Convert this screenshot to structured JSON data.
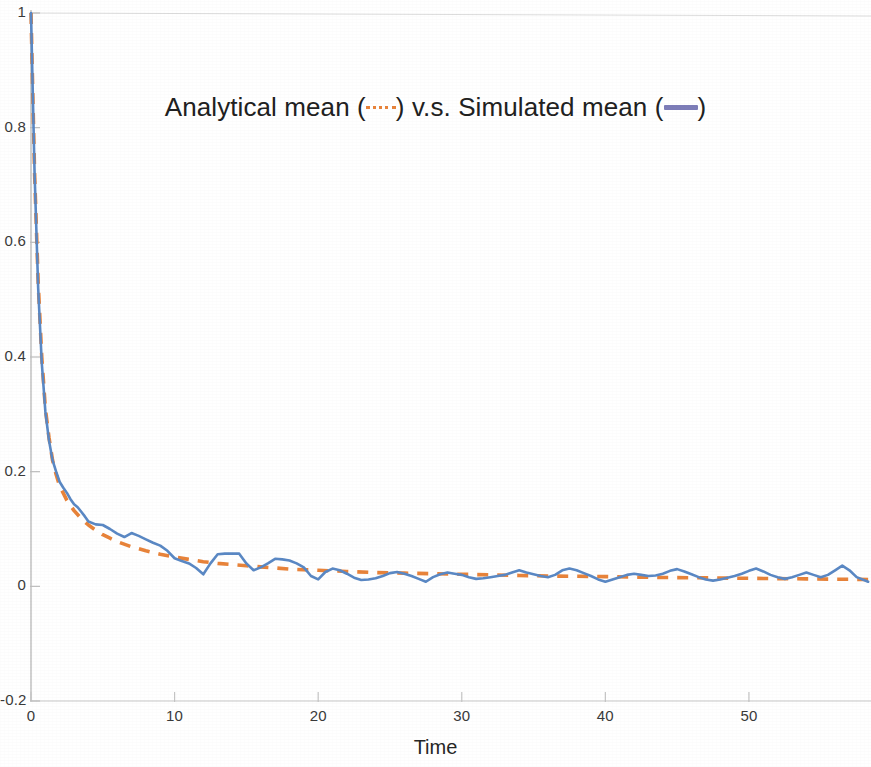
{
  "chart_data": {
    "type": "line",
    "title_parts": {
      "before_dash": "Analytical mean (",
      "mid": ") v.s. Simulated mean (",
      "after_solid": ")"
    },
    "xlabel": "Time",
    "ylabel": "",
    "xlim": [
      0,
      58.5
    ],
    "ylim": [
      -0.2,
      1.0
    ],
    "xticks": [
      0,
      10,
      20,
      30,
      40,
      50
    ],
    "xtick_labels": [
      "0",
      "10",
      "20",
      "30",
      "40",
      "50"
    ],
    "yticks": [
      -0.2,
      0,
      0.2,
      0.4,
      0.6,
      0.8,
      1
    ],
    "ytick_labels": [
      "-0.2",
      "0",
      "0.2",
      "0.4",
      "0.6",
      "0.8",
      "1"
    ],
    "grid": false,
    "legend_position": "inside-top-center",
    "colors": {
      "analytical": "#e8833a",
      "simulated": "#5a88c4",
      "legend_simulated": "#7d7db8",
      "axis": "#b9b9b9",
      "text": "#2b2b2b"
    },
    "series": [
      {
        "name": "Analytical mean",
        "style": "dashed",
        "color": "#e8833a",
        "x": [
          0,
          0.25,
          0.5,
          0.75,
          1,
          1.25,
          1.5,
          1.75,
          2,
          2.5,
          3,
          3.5,
          4,
          4.5,
          5,
          5.5,
          6,
          7,
          8,
          9,
          10,
          11,
          12,
          13,
          14,
          15,
          16,
          17,
          18,
          19,
          20,
          22,
          24,
          26,
          28,
          30,
          32,
          34,
          36,
          38,
          40,
          42,
          44,
          46,
          48,
          50,
          52,
          54,
          56,
          58.3
        ],
        "y": [
          1.0,
          0.72,
          0.53,
          0.4,
          0.31,
          0.26,
          0.22,
          0.195,
          0.175,
          0.15,
          0.132,
          0.118,
          0.107,
          0.098,
          0.09,
          0.084,
          0.078,
          0.069,
          0.062,
          0.056,
          0.051,
          0.047,
          0.043,
          0.04,
          0.038,
          0.036,
          0.034,
          0.032,
          0.03,
          0.029,
          0.028,
          0.026,
          0.024,
          0.023,
          0.022,
          0.021,
          0.02,
          0.019,
          0.018,
          0.0175,
          0.017,
          0.016,
          0.0155,
          0.015,
          0.0145,
          0.014,
          0.0135,
          0.013,
          0.0125,
          0.012
        ]
      },
      {
        "name": "Simulated mean",
        "style": "solid",
        "color": "#5a88c4",
        "x": [
          0,
          0.25,
          0.5,
          0.75,
          1,
          1.25,
          1.5,
          1.75,
          2,
          2.25,
          2.5,
          2.75,
          3,
          3.25,
          3.5,
          3.75,
          4,
          4.5,
          5,
          5.5,
          6,
          6.5,
          7,
          7.5,
          8,
          8.5,
          9,
          9.5,
          10,
          10.5,
          11,
          11.5,
          12,
          12.5,
          13,
          13.5,
          14,
          14.5,
          15,
          15.5,
          16,
          16.5,
          17,
          17.5,
          18,
          18.5,
          19,
          19.5,
          20,
          20.5,
          21,
          21.5,
          22,
          22.5,
          23,
          23.5,
          24,
          24.5,
          25,
          25.5,
          26,
          26.5,
          27,
          27.5,
          28,
          28.5,
          29,
          29.5,
          30,
          30.5,
          31,
          31.5,
          32,
          32.5,
          33,
          33.5,
          34,
          34.5,
          35,
          35.5,
          36,
          36.5,
          37,
          37.5,
          38,
          38.5,
          39,
          39.5,
          40,
          40.5,
          41,
          41.5,
          42,
          42.5,
          43,
          43.5,
          44,
          44.5,
          45,
          45.5,
          46,
          46.5,
          47,
          47.5,
          48,
          48.5,
          49,
          49.5,
          50,
          50.5,
          51,
          51.5,
          52,
          52.5,
          53,
          53.5,
          54,
          54.5,
          55,
          55.5,
          56,
          56.5,
          57,
          57.5,
          58.3
        ],
        "y": [
          1.0,
          0.72,
          0.52,
          0.39,
          0.305,
          0.255,
          0.22,
          0.2,
          0.182,
          0.172,
          0.163,
          0.152,
          0.143,
          0.138,
          0.13,
          0.122,
          0.113,
          0.108,
          0.107,
          0.1,
          0.092,
          0.086,
          0.093,
          0.088,
          0.082,
          0.076,
          0.071,
          0.062,
          0.049,
          0.044,
          0.04,
          0.032,
          0.021,
          0.04,
          0.056,
          0.057,
          0.057,
          0.057,
          0.04,
          0.028,
          0.033,
          0.04,
          0.048,
          0.047,
          0.045,
          0.04,
          0.033,
          0.018,
          0.012,
          0.025,
          0.031,
          0.028,
          0.022,
          0.015,
          0.011,
          0.012,
          0.014,
          0.018,
          0.023,
          0.025,
          0.022,
          0.018,
          0.013,
          0.008,
          0.016,
          0.021,
          0.024,
          0.022,
          0.02,
          0.016,
          0.013,
          0.014,
          0.016,
          0.018,
          0.02,
          0.024,
          0.028,
          0.024,
          0.021,
          0.018,
          0.016,
          0.02,
          0.028,
          0.031,
          0.028,
          0.023,
          0.018,
          0.012,
          0.008,
          0.012,
          0.016,
          0.02,
          0.022,
          0.02,
          0.018,
          0.019,
          0.022,
          0.027,
          0.03,
          0.026,
          0.021,
          0.016,
          0.012,
          0.01,
          0.012,
          0.015,
          0.018,
          0.022,
          0.027,
          0.031,
          0.026,
          0.02,
          0.016,
          0.013,
          0.016,
          0.02,
          0.024,
          0.02,
          0.016,
          0.02,
          0.028,
          0.036,
          0.028,
          0.016,
          0.008
        ]
      }
    ]
  },
  "axis": {
    "x_label": "Time",
    "x_tick_labels": [
      "0",
      "10",
      "20",
      "30",
      "40",
      "50"
    ],
    "y_tick_labels": [
      "1",
      "0.8",
      "0.6",
      "0.4",
      "0.2",
      "0",
      "-0.2"
    ]
  },
  "title": {
    "before_dash": "Analytical mean (",
    "mid": ") v.s. Simulated mean (",
    "after_solid": ")"
  }
}
